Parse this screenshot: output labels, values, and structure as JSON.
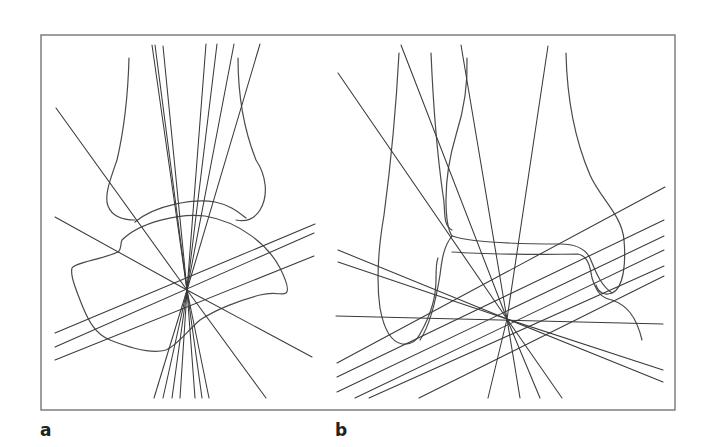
{
  "figure": {
    "panels": [
      {
        "id": "a",
        "label": "a",
        "center": [
          187,
          290
        ]
      },
      {
        "id": "b",
        "label": "b",
        "center": [
          507,
          319
        ]
      }
    ],
    "colors": {
      "frame": "#6a6a6a",
      "axis_lines": "#3a3a3a",
      "bone_outline": "#4a4a4a",
      "background": "#ffffff"
    }
  }
}
